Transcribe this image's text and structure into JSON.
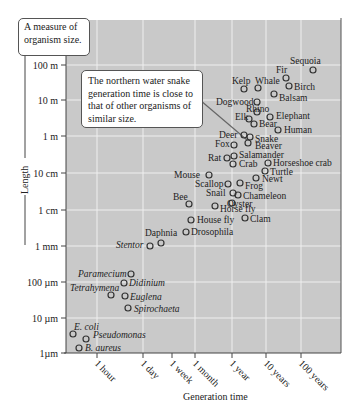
{
  "chart_data": {
    "type": "scatter",
    "title": "",
    "xlabel": "Generation time",
    "ylabel": "Length",
    "x_scale": "log",
    "y_scale": "log",
    "x_ticks": [
      "1 hour",
      "1 day",
      "1 week",
      "1 month",
      "1 year",
      "10 years",
      "100 years"
    ],
    "y_ticks": [
      "100 m",
      "10 m",
      "1 m",
      "10 cm",
      "1 cm",
      "1 mm",
      "100 µm",
      "10 µm",
      "1µm"
    ],
    "grid": true,
    "annotations": [
      {
        "text": "A measure of organism size.",
        "target": "y-axis"
      },
      {
        "text": "The northern water snake generation time is close to that of other organisms of similar size.",
        "target": "Snake"
      }
    ],
    "points": [
      {
        "name": "Sequoia",
        "gen_time_years": 500,
        "length_m": 80,
        "px": 313,
        "py": 70,
        "lx": 290,
        "ly": 64,
        "italic": false
      },
      {
        "name": "Fir",
        "gen_time_years": 200,
        "length_m": 30,
        "px": 286,
        "py": 78,
        "lx": 276,
        "ly": 73,
        "italic": false
      },
      {
        "name": "Birch",
        "gen_time_years": 150,
        "length_m": 20,
        "px": 289,
        "py": 86,
        "lx": 294,
        "ly": 90,
        "italic": false
      },
      {
        "name": "Kelp",
        "gen_time_years": 1,
        "length_m": 20,
        "px": 244,
        "py": 89,
        "lx": 232,
        "ly": 84,
        "italic": false
      },
      {
        "name": "Whale",
        "gen_time_years": 10,
        "length_m": 20,
        "px": 258,
        "py": 88,
        "lx": 255,
        "ly": 84,
        "italic": false
      },
      {
        "name": "Balsam",
        "gen_time_years": 50,
        "length_m": 15,
        "px": 274,
        "py": 94,
        "lx": 279,
        "ly": 101,
        "italic": false
      },
      {
        "name": "Dogwood",
        "gen_time_years": 5,
        "length_m": 8,
        "px": 257,
        "py": 102,
        "lx": 216,
        "ly": 105,
        "italic": false
      },
      {
        "name": "Rhino",
        "gen_time_years": 8,
        "length_m": 4,
        "px": 257,
        "py": 112,
        "lx": 246,
        "ly": 112,
        "italic": false
      },
      {
        "name": "Elephant",
        "gen_time_years": 20,
        "length_m": 4,
        "px": 270,
        "py": 117,
        "lx": 276,
        "ly": 119,
        "italic": false
      },
      {
        "name": "Elk",
        "gen_time_years": 3,
        "length_m": 2.5,
        "px": 249,
        "py": 119,
        "lx": 235,
        "ly": 120,
        "italic": false
      },
      {
        "name": "Bear",
        "gen_time_years": 4,
        "length_m": 2,
        "px": 254,
        "py": 124,
        "lx": 259,
        "ly": 127,
        "italic": false
      },
      {
        "name": "Human",
        "gen_time_years": 20,
        "length_m": 1.8,
        "px": 278,
        "py": 130,
        "lx": 284,
        "ly": 133,
        "italic": false
      },
      {
        "name": "Deer",
        "gen_time_years": 2,
        "length_m": 1.5,
        "px": 244,
        "py": 135,
        "lx": 219,
        "ly": 138,
        "italic": false
      },
      {
        "name": "Snake",
        "gen_time_years": 2.5,
        "length_m": 1,
        "px": 250,
        "py": 137,
        "lx": 255,
        "ly": 142,
        "italic": false
      },
      {
        "name": "Fox",
        "gen_time_years": 1,
        "length_m": 0.8,
        "px": 234,
        "py": 145,
        "lx": 215,
        "ly": 147,
        "italic": false
      },
      {
        "name": "Beaver",
        "gen_time_years": 2.5,
        "length_m": 0.8,
        "px": 248,
        "py": 143,
        "lx": 255,
        "ly": 149,
        "italic": false
      },
      {
        "name": "Salamander",
        "gen_time_years": 1,
        "length_m": 0.4,
        "px": 234,
        "py": 156,
        "lx": 239,
        "ly": 158,
        "italic": false
      },
      {
        "name": "Rat",
        "gen_time_years": 0.25,
        "length_m": 0.3,
        "px": 227,
        "py": 158,
        "lx": 208,
        "ly": 161,
        "italic": false
      },
      {
        "name": "Crab",
        "gen_time_years": 1,
        "length_m": 0.25,
        "px": 233,
        "py": 164,
        "lx": 239,
        "ly": 167,
        "italic": false
      },
      {
        "name": "Horseshoe crab",
        "gen_time_years": 10,
        "length_m": 0.3,
        "px": 268,
        "py": 163,
        "lx": 273,
        "ly": 166,
        "italic": false
      },
      {
        "name": "Turtle",
        "gen_time_years": 10,
        "length_m": 0.2,
        "px": 265,
        "py": 171,
        "lx": 270,
        "ly": 175,
        "italic": false
      },
      {
        "name": "Newt",
        "gen_time_years": 3,
        "length_m": 0.1,
        "px": 256,
        "py": 178,
        "lx": 262,
        "ly": 182,
        "italic": false
      },
      {
        "name": "Mouse",
        "gen_time_years": 0.2,
        "length_m": 0.1,
        "px": 209,
        "py": 175,
        "lx": 174,
        "ly": 178,
        "italic": false
      },
      {
        "name": "Scallop",
        "gen_time_years": 1,
        "length_m": 0.07,
        "px": 228,
        "py": 184,
        "lx": 195,
        "ly": 187,
        "italic": false
      },
      {
        "name": "Frog",
        "gen_time_years": 1.5,
        "length_m": 0.07,
        "px": 240,
        "py": 183,
        "lx": 245,
        "ly": 189,
        "italic": false
      },
      {
        "name": "Snail",
        "gen_time_years": 1,
        "length_m": 0.03,
        "px": 233,
        "py": 193,
        "lx": 206,
        "ly": 196,
        "italic": false
      },
      {
        "name": "Chameleon",
        "gen_time_years": 1.5,
        "length_m": 0.03,
        "px": 238,
        "py": 195,
        "lx": 243,
        "ly": 199,
        "italic": false
      },
      {
        "name": "Oyster",
        "gen_time_years": 1,
        "length_m": 0.015,
        "px": 232,
        "py": 203,
        "lx": 227,
        "ly": 207,
        "italic": false
      },
      {
        "name": "Bee",
        "gen_time_years": 0.1,
        "length_m": 0.012,
        "px": 189,
        "py": 204,
        "lx": 173,
        "ly": 200,
        "italic": false
      },
      {
        "name": "Horse fly",
        "gen_time_years": 0.15,
        "length_m": 0.015,
        "px": 215,
        "py": 206,
        "lx": 220,
        "ly": 212,
        "italic": false
      },
      {
        "name": "House fly",
        "gen_time_years": 0.06,
        "length_m": 0.006,
        "px": 191,
        "py": 220,
        "lx": 197,
        "ly": 223,
        "italic": false
      },
      {
        "name": "Clam",
        "gen_time_years": 1,
        "length_m": 0.004,
        "px": 245,
        "py": 218,
        "lx": 250,
        "ly": 222,
        "italic": false
      },
      {
        "name": "Drosophila",
        "gen_time_years": 0.03,
        "length_m": 0.003,
        "px": 186,
        "py": 232,
        "lx": 191,
        "ly": 235,
        "italic": false
      },
      {
        "name": "Daphnia",
        "gen_time_years": 0.02,
        "length_m": 0.0015,
        "px": 161,
        "py": 243,
        "lx": 145,
        "ly": 236,
        "italic": false
      },
      {
        "name": "Stentor",
        "gen_time_years": 0.008,
        "length_m": 0.001,
        "px": 150,
        "py": 246,
        "lx": 116,
        "ly": 248,
        "italic": true
      },
      {
        "name": "Paramecium",
        "gen_time_years": 0.002,
        "length_m": 0.0002,
        "px": 131,
        "py": 274,
        "lx": 78,
        "ly": 277,
        "italic": true
      },
      {
        "name": "Didinium",
        "gen_time_years": 0.001,
        "length_m": 0.0001,
        "px": 124,
        "py": 283,
        "lx": 129,
        "ly": 286,
        "italic": true
      },
      {
        "name": "Tetrahymena",
        "gen_time_years": 0.0004,
        "length_m": 5e-05,
        "px": 111,
        "py": 295,
        "lx": 70,
        "ly": 291,
        "italic": true
      },
      {
        "name": "Euglena",
        "gen_time_years": 0.001,
        "length_m": 4e-05,
        "px": 125,
        "py": 296,
        "lx": 130,
        "ly": 300,
        "italic": true
      },
      {
        "name": "Spirochaeta",
        "gen_time_years": 0.001,
        "length_m": 2e-05,
        "px": 128,
        "py": 308,
        "lx": 134,
        "ly": 312,
        "italic": true
      },
      {
        "name": "E. coli",
        "gen_time_years": 4e-05,
        "length_m": 3e-06,
        "px": 73,
        "py": 334,
        "lx": 74,
        "ly": 330,
        "italic": true
      },
      {
        "name": "Pseudomonas",
        "gen_time_years": 0.0001,
        "length_m": 2e-06,
        "px": 86,
        "py": 339,
        "lx": 93,
        "ly": 338,
        "italic": true
      },
      {
        "name": "B. aureus",
        "gen_time_years": 7e-05,
        "length_m": 1.5e-06,
        "px": 79,
        "py": 348,
        "lx": 85,
        "ly": 351,
        "italic": true
      }
    ]
  },
  "labels": {
    "y_axis_callout": "A measure of organism size.",
    "snake_callout": "The northern water snake generation time is close to that of other organisms of similar size.",
    "ylabel": "Length",
    "xlabel": "Generation time"
  }
}
